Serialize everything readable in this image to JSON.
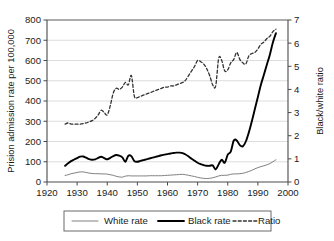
{
  "chart_data": {
    "type": "line",
    "title": "",
    "xlabel": "",
    "ylabel": "Prision admission rate per 100,000",
    "y2label": "Black/white ratio",
    "xlim": [
      1920,
      2000
    ],
    "ylim": [
      0,
      800
    ],
    "y2lim": [
      0,
      7
    ],
    "xticks": [
      1920,
      1930,
      1940,
      1950,
      1960,
      1970,
      1980,
      1990,
      2000
    ],
    "yticks": [
      0,
      100,
      200,
      300,
      400,
      500,
      600,
      700,
      800
    ],
    "y2ticks": [
      0,
      1,
      2,
      3,
      4,
      5,
      6,
      7
    ],
    "grid": "horizontal",
    "legend_position": "bottom",
    "x": [
      1926,
      1927,
      1928,
      1929,
      1930,
      1931,
      1932,
      1933,
      1934,
      1935,
      1936,
      1937,
      1938,
      1939,
      1940,
      1941,
      1942,
      1943,
      1944,
      1945,
      1946,
      1947,
      1948,
      1949,
      1950,
      1951,
      1952,
      1953,
      1954,
      1955,
      1956,
      1957,
      1958,
      1959,
      1960,
      1961,
      1962,
      1963,
      1964,
      1965,
      1966,
      1967,
      1968,
      1969,
      1970,
      1971,
      1972,
      1973,
      1974,
      1975,
      1976,
      1977,
      1978,
      1979,
      1980,
      1981,
      1982,
      1983,
      1984,
      1985,
      1986,
      1987,
      1988,
      1989,
      1990,
      1991,
      1992,
      1993,
      1994,
      1995,
      1996
    ],
    "series": [
      {
        "name": "White rate",
        "axis": "left",
        "style": "solid-thin",
        "color": "#808080",
        "values": [
          32,
          36,
          41,
          44,
          47,
          50,
          50,
          47,
          44,
          42,
          41,
          41,
          40,
          40,
          39,
          36,
          33,
          28,
          25,
          24,
          29,
          31,
          30,
          30,
          30,
          30,
          30,
          30,
          31,
          31,
          31,
          31,
          31,
          32,
          33,
          34,
          35,
          36,
          37,
          38,
          36,
          33,
          30,
          27,
          23,
          20,
          18,
          17,
          18,
          21,
          25,
          30,
          33,
          33,
          34,
          38,
          40,
          40,
          41,
          43,
          47,
          52,
          58,
          65,
          71,
          76,
          80,
          85,
          91,
          100,
          110
        ]
      },
      {
        "name": "Black rate",
        "axis": "left",
        "style": "solid-thick",
        "color": "#000000",
        "values": [
          80,
          92,
          103,
          111,
          118,
          125,
          126,
          120,
          113,
          110,
          112,
          119,
          125,
          118,
          112,
          119,
          128,
          133,
          130,
          122,
          100,
          130,
          128,
          103,
          100,
          104,
          108,
          112,
          116,
          120,
          124,
          128,
          132,
          135,
          138,
          141,
          143,
          145,
          145,
          143,
          136,
          126,
          115,
          105,
          95,
          88,
          83,
          80,
          80,
          82,
          62,
          88,
          110,
          95,
          135,
          150,
          205,
          205,
          182,
          176,
          200,
          245,
          300,
          360,
          420,
          480,
          530,
          580,
          630,
          690,
          735
        ]
      },
      {
        "name": "Ratio",
        "axis": "right",
        "style": "dashed",
        "color": "#333333",
        "values": [
          2.5,
          2.55,
          2.5,
          2.5,
          2.5,
          2.5,
          2.52,
          2.55,
          2.6,
          2.65,
          2.75,
          2.9,
          3.1,
          3.0,
          2.9,
          3.3,
          3.85,
          4.05,
          4.0,
          4.1,
          4.3,
          4.2,
          4.6,
          3.7,
          3.65,
          3.7,
          3.75,
          3.8,
          3.85,
          3.9,
          3.95,
          4.0,
          4.05,
          4.1,
          4.1,
          4.15,
          4.15,
          4.2,
          4.25,
          4.3,
          4.4,
          4.6,
          4.8,
          5.0,
          5.25,
          5.2,
          5.1,
          4.9,
          4.6,
          4.2,
          4.15,
          5.35,
          5.25,
          4.8,
          4.85,
          5.15,
          5.3,
          5.6,
          5.3,
          5.15,
          5.1,
          5.45,
          5.55,
          5.6,
          5.75,
          5.95,
          6.05,
          6.2,
          6.3,
          6.5,
          6.6
        ]
      }
    ],
    "legend": [
      {
        "label": "White rate",
        "style": "solid-thin",
        "color": "#808080"
      },
      {
        "label": "Black rate",
        "style": "solid-thick",
        "color": "#000000"
      },
      {
        "label": "Ratio",
        "style": "dashed",
        "color": "#333333"
      }
    ]
  }
}
